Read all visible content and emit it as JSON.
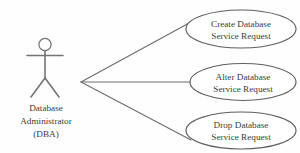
{
  "diagram": {
    "type": "uml-use-case-diagram",
    "background_color": "#fefefe",
    "line_color": "#6e6e6e",
    "text_color": "#3c3c3c",
    "actor": {
      "name": "database-administrator",
      "label_line1": "Database",
      "label_line2": "Administrator",
      "label_line3": "(DBA)"
    },
    "use_cases": [
      {
        "id": "create-database-service-request",
        "line1": "Create Database",
        "line2": "Service Request"
      },
      {
        "id": "alter-database-service-request",
        "line1": "Alter Database",
        "line2": "Service Request"
      },
      {
        "id": "drop-database-service-request",
        "line1": "Drop Database",
        "line2": "Service Request"
      }
    ],
    "associations": [
      {
        "from": "database-administrator",
        "to": "create-database-service-request"
      },
      {
        "from": "database-administrator",
        "to": "alter-database-service-request"
      },
      {
        "from": "database-administrator",
        "to": "drop-database-service-request"
      }
    ]
  }
}
